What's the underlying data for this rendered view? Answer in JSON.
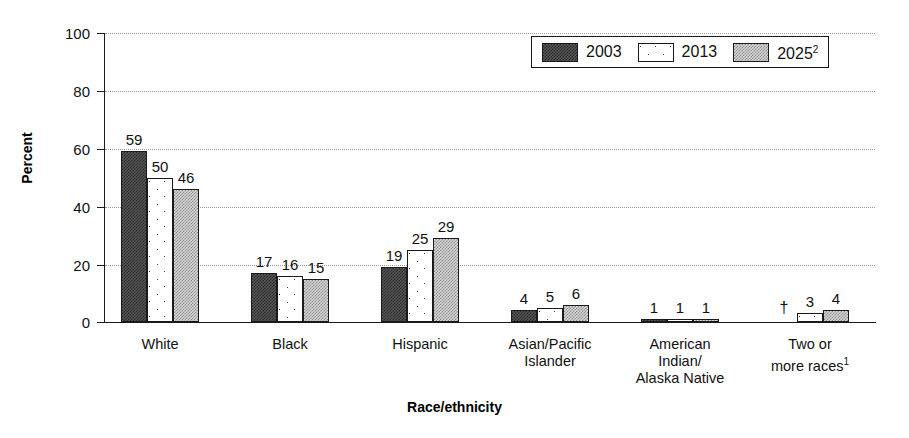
{
  "chart_data": {
    "type": "bar",
    "title": "",
    "xlabel": "Race/ethnicity",
    "ylabel": "Percent",
    "ylim": [
      0,
      100
    ],
    "yticks": [
      0,
      20,
      40,
      60,
      80,
      100
    ],
    "grid": true,
    "legend_position": "top-right",
    "categories": [
      "White",
      "Black",
      "Hispanic",
      "Asian/Pacific Islander",
      "American Indian/ Alaska Native",
      "Two or more races"
    ],
    "category_lines": [
      [
        "White"
      ],
      [
        "Black"
      ],
      [
        "Hispanic"
      ],
      [
        "Asian/Pacific",
        "Islander"
      ],
      [
        "American",
        "Indian/",
        "Alaska Native"
      ],
      [
        "Two or",
        "more races"
      ]
    ],
    "series": [
      {
        "name": "2003",
        "pattern": "dark-checker",
        "values": [
          59,
          17,
          19,
          4,
          1,
          null
        ],
        "labels": [
          "59",
          "17",
          "19",
          "4",
          "1",
          "†"
        ]
      },
      {
        "name": "2013",
        "pattern": "white-sparse-dots",
        "values": [
          50,
          16,
          25,
          5,
          1,
          3
        ],
        "labels": [
          "50",
          "16",
          "25",
          "5",
          "1",
          "3"
        ]
      },
      {
        "name": "2025",
        "pattern": "light-gray-checker",
        "values": [
          46,
          15,
          29,
          6,
          1,
          4
        ],
        "labels": [
          "46",
          "15",
          "29",
          "6",
          "1",
          "4"
        ]
      }
    ],
    "notes": {
      "two_or_more_races_superscript": "1",
      "year_2025_superscript": "2",
      "dagger_meaning": "†"
    }
  },
  "legend": {
    "items": [
      {
        "label": "2003",
        "superscript": ""
      },
      {
        "label": "2013",
        "superscript": ""
      },
      {
        "label": "2025",
        "superscript": "2"
      }
    ]
  },
  "axis": {
    "y_tick_labels": [
      "100",
      "80",
      "60",
      "40",
      "20",
      "0"
    ],
    "y_title": "Percent",
    "x_title": "Race/ethnicity"
  }
}
